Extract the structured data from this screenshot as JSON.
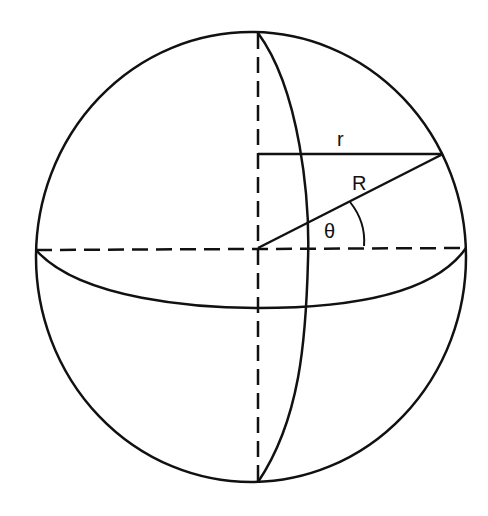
{
  "diagram": {
    "type": "sphere-geometry",
    "labels": {
      "small_radius": "r",
      "sphere_radius": "R",
      "angle": "θ"
    },
    "colors": {
      "stroke": "#111111",
      "background": "#ffffff"
    }
  }
}
